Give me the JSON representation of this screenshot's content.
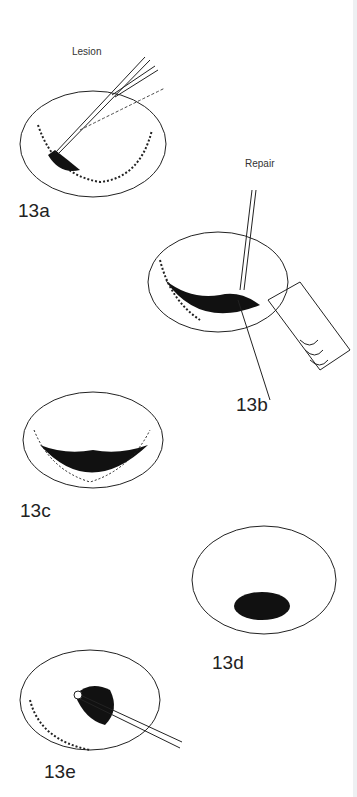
{
  "figure": {
    "panels": [
      {
        "id": "13a",
        "label": "13a",
        "annotation": "Lesion"
      },
      {
        "id": "13b",
        "label": "13b",
        "annotation": "Repair"
      },
      {
        "id": "13c",
        "label": "13c"
      },
      {
        "id": "13d",
        "label": "13d"
      },
      {
        "id": "13e",
        "label": "13e"
      }
    ]
  }
}
